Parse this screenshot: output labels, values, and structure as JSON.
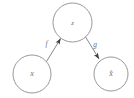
{
  "figure": {
    "name": "autoencoder-mapping-diagram",
    "background_color": "#ffffff",
    "stroke_color": "#8c8c8c",
    "text_color": "#6f6f6f",
    "arrow_color": "#4a4a4a",
    "stroke_width": 0.9,
    "width": 134,
    "height": 98
  },
  "nodes": [
    {
      "id": "x",
      "label": "x",
      "role": "input",
      "cx": 32,
      "cy": 74,
      "r": 19,
      "font_size": 8
    },
    {
      "id": "z",
      "label": "z",
      "role": "latent",
      "cx": 72.5,
      "cy": 22.5,
      "r": 19.5,
      "font_size": 7
    },
    {
      "id": "xhat",
      "label": "x̂",
      "role": "reconstruction",
      "cx": 111,
      "cy": 74,
      "r": 17,
      "font_size": 8
    }
  ],
  "edges": [
    {
      "id": "f",
      "label": "f",
      "from": "x",
      "to": "z",
      "x1": 46.5,
      "y1": 61.5,
      "x2": 59.5,
      "y2": 37.5,
      "label_x": 47,
      "label_y": 44,
      "label_font_size": 7.5,
      "arrow_angle_deg": -61
    },
    {
      "id": "g",
      "label": "g",
      "from": "z",
      "to": "xhat",
      "x1": 85,
      "y1": 36,
      "x2": 99.5,
      "y2": 59.5,
      "label_x": 95,
      "label_y": 45,
      "label_font_size": 7.5,
      "arrow_angle_deg": 58
    }
  ]
}
